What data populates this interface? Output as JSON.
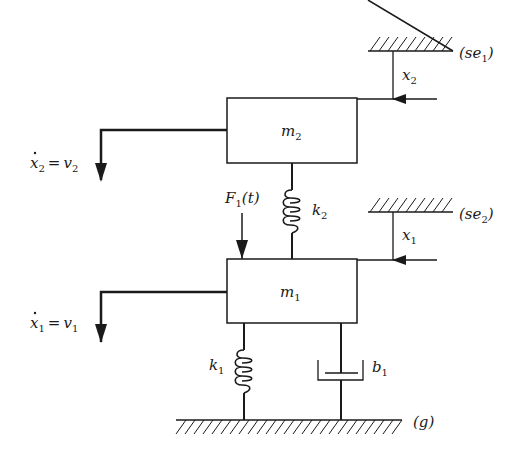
{
  "diagram": {
    "type": "two-mass spring-damper mechanical system",
    "colors": {
      "line": "#1a1a1a",
      "background": "#ffffff"
    },
    "masses": [
      {
        "id": "m2",
        "label": "m",
        "subscript": "2"
      },
      {
        "id": "m1",
        "label": "m",
        "subscript": "1"
      }
    ],
    "springs": [
      {
        "id": "k2",
        "label": "k",
        "subscript": "2",
        "connects": [
          "m2",
          "m1"
        ]
      },
      {
        "id": "k1",
        "label": "k",
        "subscript": "1",
        "connects": [
          "m1",
          "g"
        ]
      }
    ],
    "dampers": [
      {
        "id": "b1",
        "label": "b",
        "subscript": "1",
        "connects": [
          "m1",
          "g"
        ]
      }
    ],
    "forces": [
      {
        "id": "F1",
        "label": "F",
        "subscript": "1",
        "arg": "(t)",
        "acts_on": "m1"
      }
    ],
    "references": [
      {
        "id": "se1",
        "text": "(se",
        "subscript": "1",
        "close": ")"
      },
      {
        "id": "se2",
        "text": "(se",
        "subscript": "2",
        "close": ")"
      },
      {
        "id": "g",
        "text": "(g)"
      }
    ],
    "displacements": [
      {
        "id": "x2",
        "label": "x",
        "subscript": "2"
      },
      {
        "id": "x1",
        "label": "x",
        "subscript": "1"
      }
    ],
    "velocities": [
      {
        "id": "v2",
        "lhs": "x",
        "lhs_sub": "2",
        "eq": "=",
        "rhs": "v",
        "rhs_sub": "2"
      },
      {
        "id": "v1",
        "lhs": "x",
        "lhs_sub": "1",
        "eq": "=",
        "rhs": "v",
        "rhs_sub": "1"
      }
    ]
  }
}
